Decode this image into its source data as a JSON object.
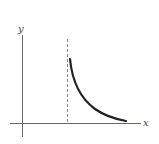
{
  "diagram": {
    "axes": {
      "x_label": "x",
      "y_label": "y"
    },
    "asymptote": {
      "style": "dashed",
      "orientation": "vertical"
    },
    "curve": {
      "description": "decreasing concave-up curve starting at the vertical asymptote and approaching the x-axis"
    },
    "colors": {
      "axis": "#666666",
      "curve": "#222222",
      "asymptote": "#888888"
    }
  }
}
